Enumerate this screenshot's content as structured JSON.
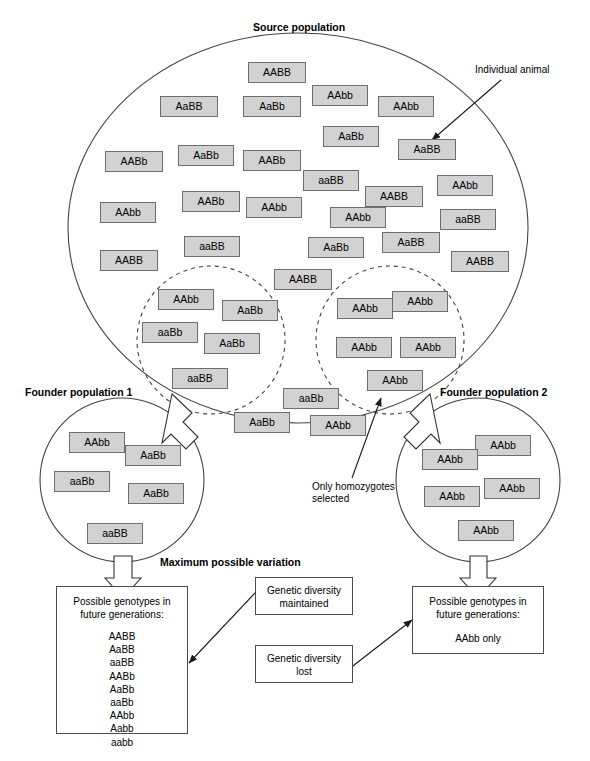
{
  "diagram": {
    "title_source": "Source population",
    "annotations": {
      "individual_animal": "Individual animal",
      "only_homozygotes_1": "Only homozygotes",
      "only_homozygotes_2": "selected",
      "max_variation": "Maximum possible variation",
      "founder1": "Founder population 1",
      "founder2": "Founder population 2"
    },
    "source_population": [
      {
        "g": "AABB",
        "x": 248,
        "y": 62,
        "w": 58,
        "h": 21
      },
      {
        "g": "AaBB",
        "x": 160,
        "y": 96,
        "w": 58,
        "h": 21
      },
      {
        "g": "AaBb",
        "x": 243,
        "y": 96,
        "w": 58,
        "h": 21
      },
      {
        "g": "AAbb",
        "x": 312,
        "y": 85,
        "w": 56,
        "h": 21
      },
      {
        "g": "AAbb",
        "x": 378,
        "y": 96,
        "w": 56,
        "h": 21
      },
      {
        "g": "AaBb",
        "x": 323,
        "y": 126,
        "w": 56,
        "h": 21
      },
      {
        "g": "AaBB",
        "x": 398,
        "y": 139,
        "w": 58,
        "h": 21
      },
      {
        "g": "AABb",
        "x": 105,
        "y": 151,
        "w": 58,
        "h": 21
      },
      {
        "g": "AaBb",
        "x": 178,
        "y": 145,
        "w": 56,
        "h": 21
      },
      {
        "g": "AABb",
        "x": 243,
        "y": 150,
        "w": 58,
        "h": 21
      },
      {
        "g": "aaBB",
        "x": 303,
        "y": 170,
        "w": 56,
        "h": 21
      },
      {
        "g": "AAbb",
        "x": 437,
        "y": 175,
        "w": 56,
        "h": 21
      },
      {
        "g": "AABb",
        "x": 182,
        "y": 191,
        "w": 58,
        "h": 21
      },
      {
        "g": "AAbb",
        "x": 246,
        "y": 197,
        "w": 56,
        "h": 21
      },
      {
        "g": "AABB",
        "x": 365,
        "y": 186,
        "w": 58,
        "h": 21
      },
      {
        "g": "AAbb",
        "x": 100,
        "y": 202,
        "w": 56,
        "h": 21
      },
      {
        "g": "AAbb",
        "x": 330,
        "y": 207,
        "w": 56,
        "h": 21
      },
      {
        "g": "aaBB",
        "x": 440,
        "y": 209,
        "w": 56,
        "h": 21
      },
      {
        "g": "aaBB",
        "x": 184,
        "y": 236,
        "w": 56,
        "h": 21
      },
      {
        "g": "AABB",
        "x": 100,
        "y": 250,
        "w": 58,
        "h": 21
      },
      {
        "g": "AaBb",
        "x": 308,
        "y": 237,
        "w": 56,
        "h": 21
      },
      {
        "g": "AaBB",
        "x": 382,
        "y": 232,
        "w": 58,
        "h": 21
      },
      {
        "g": "AABB",
        "x": 451,
        "y": 251,
        "w": 58,
        "h": 21
      },
      {
        "g": "AABB",
        "x": 274,
        "y": 269,
        "w": 58,
        "h": 21
      }
    ],
    "left_selection": [
      {
        "g": "AAbb",
        "x": 158,
        "y": 289,
        "w": 56,
        "h": 21
      },
      {
        "g": "AaBb",
        "x": 222,
        "y": 300,
        "w": 56,
        "h": 21
      },
      {
        "g": "aaBb",
        "x": 142,
        "y": 322,
        "w": 56,
        "h": 21
      },
      {
        "g": "AaBb",
        "x": 204,
        "y": 333,
        "w": 56,
        "h": 21
      },
      {
        "g": "aaBB",
        "x": 172,
        "y": 368,
        "w": 56,
        "h": 21
      }
    ],
    "right_selection": [
      {
        "g": "AAbb",
        "x": 337,
        "y": 298,
        "w": 56,
        "h": 21
      },
      {
        "g": "AAbb",
        "x": 392,
        "y": 291,
        "w": 56,
        "h": 21
      },
      {
        "g": "AAbb",
        "x": 336,
        "y": 337,
        "w": 56,
        "h": 21
      },
      {
        "g": "AAbb",
        "x": 400,
        "y": 337,
        "w": 56,
        "h": 21
      },
      {
        "g": "AAbb",
        "x": 367,
        "y": 370,
        "w": 56,
        "h": 21
      }
    ],
    "lower_source": [
      {
        "g": "aaBb",
        "x": 283,
        "y": 388,
        "w": 56,
        "h": 21
      },
      {
        "g": "AaBb",
        "x": 234,
        "y": 412,
        "w": 56,
        "h": 21
      },
      {
        "g": "AAbb",
        "x": 310,
        "y": 415,
        "w": 56,
        "h": 21
      }
    ],
    "founder1_members": [
      {
        "g": "AAbb",
        "x": 69,
        "y": 432,
        "w": 56,
        "h": 21
      },
      {
        "g": "AaBb",
        "x": 125,
        "y": 445,
        "w": 56,
        "h": 21
      },
      {
        "g": "aaBb",
        "x": 54,
        "y": 471,
        "w": 56,
        "h": 21
      },
      {
        "g": "AaBb",
        "x": 128,
        "y": 483,
        "w": 56,
        "h": 21
      },
      {
        "g": "aaBB",
        "x": 87,
        "y": 523,
        "w": 56,
        "h": 21
      }
    ],
    "founder2_members": [
      {
        "g": "AAbb",
        "x": 475,
        "y": 435,
        "w": 56,
        "h": 21
      },
      {
        "g": "AAbb",
        "x": 422,
        "y": 449,
        "w": 56,
        "h": 21
      },
      {
        "g": "AAbb",
        "x": 484,
        "y": 478,
        "w": 56,
        "h": 21
      },
      {
        "g": "AAbb",
        "x": 424,
        "y": 486,
        "w": 56,
        "h": 21
      },
      {
        "g": "AAbb",
        "x": 458,
        "y": 520,
        "w": 56,
        "h": 21
      }
    ],
    "outcome_left": {
      "heading_line1": "Possible genotypes in",
      "heading_line2": "future generations:",
      "genotypes": [
        "AABB",
        "AaBB",
        "aaBB",
        "AABb",
        "AaBb",
        "aaBb",
        "AAbb",
        "Aabb",
        "aabb"
      ]
    },
    "outcome_right": {
      "heading_line1": "Possible genotypes in",
      "heading_line2": "future generations:",
      "result": "AAbb only"
    },
    "note_maintained_l1": "Genetic diversity",
    "note_maintained_l2": "maintained",
    "note_lost_l1": "Genetic diversity",
    "note_lost_l2": "lost"
  },
  "colors": {
    "chip_fill": "#d2d2d2",
    "chip_border": "#6e6e6e",
    "line": "#3a3a3a",
    "box_border": "#4a4a4a"
  }
}
